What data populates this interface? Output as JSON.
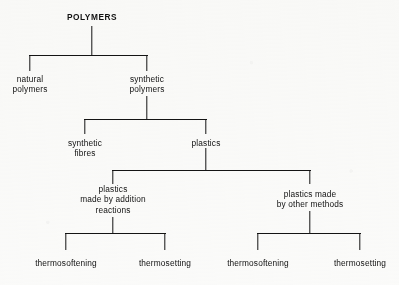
{
  "diagram": {
    "title": "POLYMERS",
    "type": "hierarchy-tree",
    "orientation": "top-down",
    "line_color": "#141414",
    "text_color": "#111111",
    "background_color": "#fbfbfa",
    "levels": [
      {
        "level": 0,
        "nodes": [
          {
            "id": "polymers",
            "label": "POLYMERS",
            "x": 92,
            "y": 12,
            "emphasis": "bold-caps"
          }
        ]
      },
      {
        "level": 1,
        "nodes": [
          {
            "id": "natural-polymers",
            "label": "natural\npolymers",
            "x": 30,
            "y": 74
          },
          {
            "id": "synthetic-polymers",
            "label": "synthetic\npolymers",
            "x": 147,
            "y": 74
          }
        ]
      },
      {
        "level": 2,
        "nodes": [
          {
            "id": "synthetic-fibres",
            "label": "synthetic\nfibres",
            "x": 85,
            "y": 138
          },
          {
            "id": "plastics",
            "label": "plastics",
            "x": 206,
            "y": 138
          }
        ]
      },
      {
        "level": 3,
        "nodes": [
          {
            "id": "plastics-addition",
            "label": "plastics\nmade by addition\nreactions",
            "x": 113,
            "y": 184
          },
          {
            "id": "plastics-other",
            "label": "plastics made\nby other methods",
            "x": 310,
            "y": 189
          }
        ]
      },
      {
        "level": 4,
        "nodes": [
          {
            "id": "thermosoftening-addition",
            "label": "thermosoftening",
            "x": 66,
            "y": 258
          },
          {
            "id": "thermosetting-addition",
            "label": "thermosetting",
            "x": 165,
            "y": 258
          },
          {
            "id": "thermosoftening-other",
            "label": "thermosoftening",
            "x": 258,
            "y": 258
          },
          {
            "id": "thermosetting-other",
            "label": "thermosetting",
            "x": 360,
            "y": 258
          }
        ]
      }
    ],
    "connectors": [
      {
        "id": "stem-polymers",
        "kind": "v",
        "x": 92,
        "y": 26,
        "length": 29
      },
      {
        "id": "bar-polymers",
        "kind": "h",
        "x": 29,
        "y": 55,
        "length": 119
      },
      {
        "id": "drop-natural",
        "kind": "v",
        "x": 30,
        "y": 55,
        "length": 16
      },
      {
        "id": "drop-synthetic",
        "kind": "v",
        "x": 147,
        "y": 55,
        "length": 16
      },
      {
        "id": "stem-synthetic",
        "kind": "v",
        "x": 147,
        "y": 96,
        "length": 24
      },
      {
        "id": "bar-synthetic",
        "kind": "h",
        "x": 84,
        "y": 119,
        "length": 123
      },
      {
        "id": "drop-fibres",
        "kind": "v",
        "x": 85,
        "y": 119,
        "length": 15
      },
      {
        "id": "drop-plastics",
        "kind": "v",
        "x": 206,
        "y": 119,
        "length": 15
      },
      {
        "id": "stem-plastics",
        "kind": "v",
        "x": 206,
        "y": 148,
        "length": 23
      },
      {
        "id": "bar-plastics",
        "kind": "h",
        "x": 112,
        "y": 170,
        "length": 199
      },
      {
        "id": "drop-addition",
        "kind": "v",
        "x": 113,
        "y": 170,
        "length": 14
      },
      {
        "id": "drop-other",
        "kind": "v",
        "x": 310,
        "y": 170,
        "length": 14
      },
      {
        "id": "stem-addition",
        "kind": "v",
        "x": 113,
        "y": 217,
        "length": 17
      },
      {
        "id": "bar-addition",
        "kind": "h",
        "x": 65,
        "y": 233,
        "length": 101
      },
      {
        "id": "drop-thermosoft-add",
        "kind": "v",
        "x": 66,
        "y": 233,
        "length": 17
      },
      {
        "id": "drop-thermoset-add",
        "kind": "v",
        "x": 165,
        "y": 233,
        "length": 17
      },
      {
        "id": "stem-other",
        "kind": "v",
        "x": 310,
        "y": 211,
        "length": 23
      },
      {
        "id": "bar-other",
        "kind": "h",
        "x": 257,
        "y": 233,
        "length": 104
      },
      {
        "id": "drop-thermosoft-oth",
        "kind": "v",
        "x": 258,
        "y": 233,
        "length": 17
      },
      {
        "id": "drop-thermoset-oth",
        "kind": "v",
        "x": 360,
        "y": 233,
        "length": 17
      }
    ]
  }
}
